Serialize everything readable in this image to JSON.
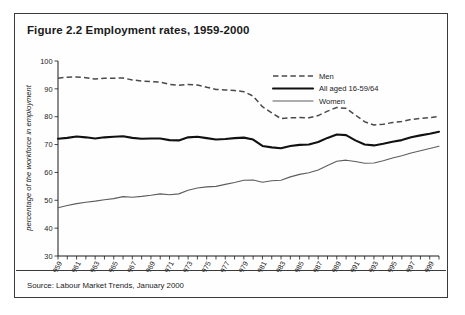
{
  "figure": {
    "title": "Figure 2.2 Employment rates, 1959-2000",
    "source": "Source: Labour Market Trends, January 2000"
  },
  "chart_data": {
    "type": "line",
    "title": "Figure 2.2 Employment rates, 1959-2000",
    "xlabel": "",
    "ylabel": "percentage of the workforce in employment",
    "ylim": [
      30,
      100
    ],
    "ytick_values": [
      30,
      40,
      50,
      60,
      70,
      80,
      90,
      100
    ],
    "xlim": [
      1959,
      2000
    ],
    "grid": false,
    "legend_position": "top-right",
    "x": [
      1959,
      1960,
      1961,
      1962,
      1963,
      1964,
      1965,
      1966,
      1967,
      1968,
      1969,
      1970,
      1971,
      1972,
      1973,
      1974,
      1975,
      1976,
      1977,
      1978,
      1979,
      1980,
      1981,
      1982,
      1983,
      1984,
      1985,
      1986,
      1987,
      1988,
      1989,
      1990,
      1991,
      1992,
      1993,
      1994,
      1995,
      1996,
      1997,
      1998,
      1999,
      2000
    ],
    "xtick_labels": [
      "1959",
      "1961",
      "1963",
      "1965",
      "1967",
      "1969",
      "1971",
      "1973",
      "1975",
      "1977",
      "1979",
      "1981",
      "1983",
      "1985",
      "1987",
      "1989",
      "1991",
      "1993",
      "1995",
      "1997",
      "1999"
    ],
    "series": [
      {
        "name": "Men",
        "style": "dashed",
        "color": "#4a4a4a",
        "values": [
          93.8,
          94.2,
          94.3,
          94.0,
          93.5,
          93.8,
          93.8,
          93.9,
          93.2,
          92.8,
          92.6,
          92.4,
          91.6,
          91.3,
          91.6,
          91.4,
          90.6,
          89.8,
          89.6,
          89.4,
          89.0,
          87.4,
          83.6,
          81.4,
          79.3,
          79.6,
          79.7,
          79.6,
          80.4,
          82.0,
          83.3,
          83.0,
          80.6,
          78.2,
          77.0,
          77.3,
          77.9,
          78.3,
          79.0,
          79.4,
          79.7,
          80.1
        ]
      },
      {
        "name": "All aged 16-59/64",
        "style": "solid-thick",
        "color": "#111111",
        "values": [
          72.1,
          72.4,
          72.9,
          72.6,
          72.2,
          72.6,
          72.8,
          73.0,
          72.4,
          72.1,
          72.2,
          72.2,
          71.6,
          71.5,
          72.6,
          72.8,
          72.3,
          71.8,
          72.0,
          72.3,
          72.5,
          71.8,
          69.5,
          69.0,
          68.7,
          69.5,
          69.9,
          70.0,
          70.9,
          72.4,
          73.6,
          73.4,
          71.5,
          70.0,
          69.7,
          70.3,
          71.0,
          71.6,
          72.6,
          73.3,
          73.9,
          74.6
        ]
      },
      {
        "name": "Women",
        "style": "solid-thin",
        "color": "#5d5d5d",
        "values": [
          47.3,
          48.1,
          48.8,
          49.3,
          49.7,
          50.2,
          50.6,
          51.3,
          51.1,
          51.4,
          51.8,
          52.3,
          52.0,
          52.3,
          53.6,
          54.4,
          54.8,
          55.0,
          55.7,
          56.4,
          57.2,
          57.3,
          56.5,
          57.0,
          57.2,
          58.4,
          59.3,
          59.9,
          60.9,
          62.5,
          64.0,
          64.4,
          63.9,
          63.3,
          63.4,
          64.2,
          65.2,
          66.0,
          67.0,
          67.8,
          68.6,
          69.4
        ]
      }
    ]
  },
  "legend": {
    "items": [
      {
        "label": "Men"
      },
      {
        "label": "All aged 16-59/64"
      },
      {
        "label": "Women"
      }
    ]
  }
}
